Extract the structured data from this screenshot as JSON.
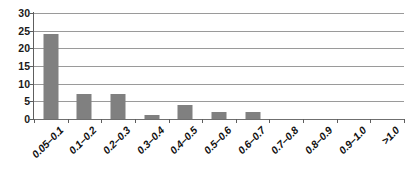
{
  "chart_data": {
    "type": "bar",
    "title": "",
    "xlabel": "",
    "ylabel": "",
    "categories": [
      "0.05–0.1",
      "0.1–0.2",
      "0.2–0.3",
      "0.3–0.4",
      "0.4–0.5",
      "0.5–0.6",
      "0.6–0.7",
      "0.7–0.8",
      "0.8–0.9",
      "0.9–1.0",
      ">1.0"
    ],
    "values": [
      24,
      7,
      7,
      1,
      4,
      2,
      2,
      0,
      0,
      0,
      0
    ],
    "ylim": [
      0,
      30
    ],
    "yticks": [
      0,
      5,
      10,
      15,
      20,
      25,
      30
    ],
    "ytick_labels": [
      "0",
      "5",
      "10",
      "15",
      "20",
      "25",
      "30"
    ],
    "grid": true,
    "legend": false,
    "bar_color": "#808080",
    "gridline_color": "#9a9a9a",
    "axis_color": "#5e5e5e",
    "background_color": "#ffffff"
  }
}
